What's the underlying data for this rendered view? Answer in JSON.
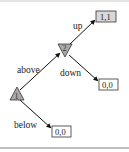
{
  "diagram": {
    "type": "game-tree",
    "colors": {
      "node_fill": "#a9a9a9",
      "leaf_fill_highlight": "#d8d8d8",
      "leaf_fill": "#ffffff",
      "edge": "#111111"
    },
    "nodes": [
      {
        "id": "n1",
        "label": "1",
        "shape": "triangle-up"
      },
      {
        "id": "n2",
        "label": "2",
        "shape": "triangle-down"
      }
    ],
    "leaves": [
      {
        "id": "leaf-up",
        "payoff": "1,1",
        "highlighted": true
      },
      {
        "id": "leaf-down",
        "payoff": "0,0",
        "highlighted": false
      },
      {
        "id": "leaf-below",
        "payoff": "0,0",
        "highlighted": false
      }
    ],
    "edges": [
      {
        "from": "n1",
        "to": "n2",
        "label": "above"
      },
      {
        "from": "n1",
        "to": "leaf-below",
        "label": "below"
      },
      {
        "from": "n2",
        "to": "leaf-up",
        "label": "up"
      },
      {
        "from": "n2",
        "to": "leaf-down",
        "label": "down"
      }
    ]
  }
}
